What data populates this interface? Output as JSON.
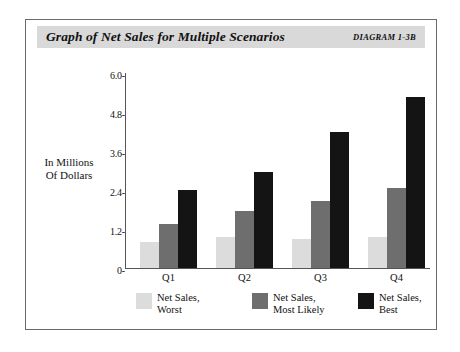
{
  "figure": {
    "title": "Graph of Net Sales for Multiple Scenarios",
    "diagram_label": "DIAGRAM 1-3B",
    "title_band_color": "#d9d9d9",
    "frame_color": "#6b6b6b"
  },
  "chart_data": {
    "type": "bar",
    "title": "Graph of Net Sales for Multiple Scenarios",
    "xlabel": "",
    "ylabel": "In Millions Of Dollars",
    "ylabel_line1": "In Millions",
    "ylabel_line2": "Of Dollars",
    "categories": [
      "Q1",
      "Q2",
      "Q3",
      "Q4"
    ],
    "series": [
      {
        "name": "Net Sales, Worst",
        "name_line1": "Net Sales,",
        "name_line2": "Worst",
        "color": "#dcdcdc",
        "values": [
          0.8,
          0.95,
          0.9,
          0.95
        ]
      },
      {
        "name": "Net Sales, Most Likely",
        "name_line1": "Net  Sales,",
        "name_line2": "Most Likely",
        "color": "#6e6e6e",
        "values": [
          1.35,
          1.75,
          2.05,
          2.45
        ]
      },
      {
        "name": "Net Sales, Best",
        "name_line1": "Net Sales,",
        "name_line2": "Best",
        "color": "#141414",
        "values": [
          2.4,
          2.95,
          4.2,
          5.25
        ]
      }
    ],
    "ylim": [
      0,
      6.0
    ],
    "yticks": [
      0,
      1.2,
      2.4,
      3.6,
      4.8,
      6.0
    ],
    "ytick_labels": [
      "0",
      "1.2",
      "2.4",
      "3.6",
      "4.8",
      "6.0"
    ],
    "grid": false,
    "legend_position": "bottom"
  }
}
